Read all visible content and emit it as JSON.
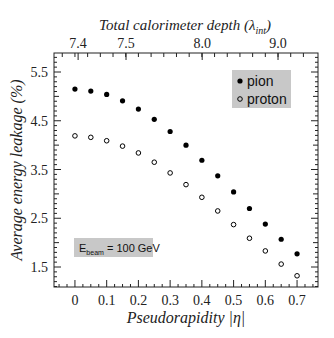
{
  "chart_data": {
    "type": "scatter",
    "title": "",
    "xlabel": "Pseudorapidity |η|",
    "ylabel": "Average energy leakage (%)",
    "top_xlabel": "Total calorimeter depth (λint)",
    "xlim": [
      -0.066,
      0.766
    ],
    "ylim": [
      1.09,
      5.89
    ],
    "x_ticks": [
      0,
      0.1,
      0.2,
      0.3,
      0.4,
      0.5,
      0.6,
      0.7
    ],
    "x_tick_labels": [
      "0",
      "0.1",
      "0.2",
      "0.3",
      "0.4",
      "0.5",
      "0.6",
      "0.7"
    ],
    "y_ticks": [
      1.5,
      2.5,
      3.5,
      4.5,
      5.5
    ],
    "y_tick_labels": [
      "1.5",
      "2.5",
      "3.5",
      "4.5",
      "5.5"
    ],
    "top_ticks": [
      {
        "label": "7.4",
        "eta": 0.01
      },
      {
        "label": "7.5",
        "eta": 0.161
      },
      {
        "label": "8.0",
        "eta": 0.401
      },
      {
        "label": "9.0",
        "eta": 0.64
      }
    ],
    "grid": false,
    "legend_position": "upper right",
    "x": [
      0,
      0.05,
      0.1,
      0.15,
      0.2,
      0.25,
      0.3,
      0.35,
      0.4,
      0.45,
      0.5,
      0.55,
      0.6,
      0.65,
      0.7
    ],
    "series": [
      {
        "name": "pion",
        "marker": "filled-circle",
        "values": [
          5.15,
          5.11,
          5.04,
          4.91,
          4.74,
          4.53,
          4.28,
          4.0,
          3.69,
          3.37,
          3.04,
          2.7,
          2.38,
          2.07,
          1.77
        ]
      },
      {
        "name": "proton",
        "marker": "open-circle",
        "values": [
          4.19,
          4.16,
          4.09,
          3.98,
          3.84,
          3.65,
          3.43,
          3.19,
          2.93,
          2.65,
          2.37,
          2.09,
          1.83,
          1.56,
          1.32
        ]
      }
    ],
    "annotations": [
      {
        "text": "E_beam = 100 GeV",
        "position": "lower left"
      }
    ]
  },
  "labels": {
    "top_axis_title": "Total calorimeter depth (λ",
    "top_axis_sub": "int",
    "top_axis_close": ")",
    "y_axis_title": "Average energy leakage (%)",
    "x_axis_title": "Pseudorapidity |η|",
    "legend_pion": "pion",
    "legend_proton": "proton",
    "annotation_E": "E",
    "annotation_sub": "beam",
    "annotation_rest": " = 100 GeV"
  },
  "colors": {
    "legend_bg": "#c8c8c8",
    "annotation_bg": "#c8c8c8",
    "axis": "#222222",
    "marker": "#000000"
  }
}
